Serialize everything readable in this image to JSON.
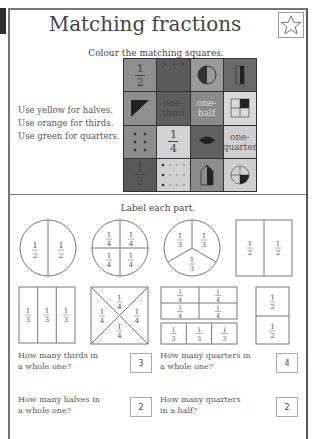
{
  "header": {
    "title": "Matching fractions",
    "star_icon": "star-outline-icon"
  },
  "section1": {
    "instruction": "Colour the matching squares.",
    "color_rules": [
      "Use yellow for halves.",
      "Use orange for thirds.",
      "Use green for quarters."
    ],
    "grid": [
      [
        {
          "type": "fraction",
          "num": "1",
          "den": "2"
        },
        {
          "type": "dots-dark"
        },
        {
          "type": "half-circle"
        },
        {
          "type": "half-bar"
        }
      ],
      [
        {
          "type": "triangle"
        },
        {
          "type": "word",
          "text": "one-third"
        },
        {
          "type": "word",
          "text": "one-half"
        },
        {
          "type": "quarter-square"
        }
      ],
      [
        {
          "type": "dots-6"
        },
        {
          "type": "fraction",
          "num": "1",
          "den": "4"
        },
        {
          "type": "leaf"
        },
        {
          "type": "word",
          "text": "one-quarter"
        }
      ],
      [
        {
          "type": "fraction",
          "num": "1",
          "den": "3"
        },
        {
          "type": "dots-12"
        },
        {
          "type": "house"
        },
        {
          "type": "quarter-circle"
        }
      ]
    ]
  },
  "section2": {
    "instruction": "Label each part.",
    "shapes": [
      {
        "shape": "circle-halves",
        "labels": [
          "1/2",
          "1/2"
        ]
      },
      {
        "shape": "circle-quarters",
        "labels": [
          "1/4",
          "1/4",
          "1/4",
          "1/4"
        ]
      },
      {
        "shape": "circle-thirds",
        "labels": [
          "1/3",
          "1/3",
          "1/3"
        ]
      },
      {
        "shape": "rect-halves",
        "labels": [
          "1/2",
          "1/2"
        ]
      },
      {
        "shape": "rect-thirds",
        "labels": [
          "1/3",
          "1/3",
          "1/3"
        ]
      },
      {
        "shape": "square-diagonal-quarters",
        "labels": [
          "1/4",
          "1/4",
          "1/4",
          "1/4"
        ]
      },
      {
        "shape": "rect-quarters-and-thirds",
        "labels": [
          "1/4",
          "1/4",
          "1/4",
          "1/4",
          "1/3",
          "1/3",
          "1/3"
        ]
      },
      {
        "shape": "rect-vertical-halves",
        "labels": [
          "1/2",
          "1/2"
        ]
      }
    ],
    "questions": [
      {
        "text_line1": "How many thirds in",
        "text_line2": "a whole one?",
        "answer": "3"
      },
      {
        "text_line1": "How many quarters in",
        "text_line2": "a whole one?",
        "answer": "4"
      },
      {
        "text_line1": "How many halves in",
        "text_line2": "a whole one?",
        "answer": "2"
      },
      {
        "text_line1": "How many quarters",
        "text_line2": "in a half?",
        "answer": "2"
      }
    ]
  }
}
